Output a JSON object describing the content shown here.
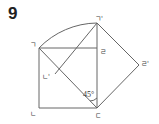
{
  "problem_number": "9",
  "labels": {
    "A": "ㄱ",
    "B": "ㄴ",
    "C": "ㄷ",
    "D": "ㄹ",
    "A_prime": "ㄱ'",
    "B_prime": "ㄴ'",
    "D_prime": "ㄹ'"
  },
  "angle_label": "45°"
}
